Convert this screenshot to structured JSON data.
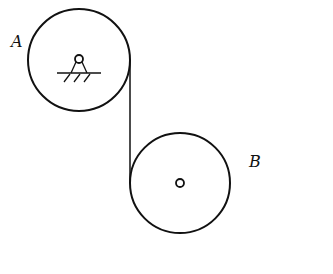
{
  "diagram": {
    "pulley_a": {
      "label": "A",
      "center": [
        79,
        60
      ],
      "radius": 51,
      "support": "fixed pivot with ground hatching"
    },
    "pulley_b": {
      "label": "B",
      "center": [
        180,
        183
      ],
      "radius": 50,
      "support": "free axle"
    },
    "rope": {
      "from": [
        130,
        60
      ],
      "to": [
        130,
        183
      ],
      "description": "vertical rope from right side of A to left side of B"
    },
    "stroke_color": "#111111",
    "background": "#ffffff"
  }
}
